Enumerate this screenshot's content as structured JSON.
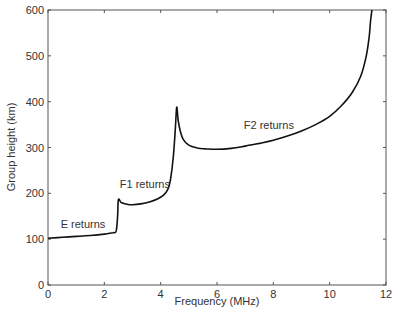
{
  "chart_data": {
    "type": "line",
    "title": "",
    "xlabel": "Frequency (MHz)",
    "ylabel": "Group height (km)",
    "xlim": [
      0,
      12
    ],
    "ylim": [
      0,
      600
    ],
    "xticks": [
      0,
      2,
      4,
      6,
      8,
      10,
      12
    ],
    "yticks": [
      0,
      100,
      200,
      300,
      400,
      500,
      600
    ],
    "grid": false,
    "legend": null,
    "annotations": [
      {
        "text": "E returns",
        "x": 0.45,
        "y": 125
      },
      {
        "text": "F1 returns",
        "x": 2.55,
        "y": 212
      },
      {
        "text": "F2 returns",
        "x": 6.95,
        "y": 340
      }
    ],
    "series": [
      {
        "name": "ionogram trace",
        "color": "#111111",
        "x": [
          0.0,
          0.5,
          1.0,
          1.5,
          2.0,
          2.3,
          2.42,
          2.47,
          2.5,
          2.6,
          2.8,
          3.0,
          3.3,
          3.6,
          3.9,
          4.1,
          4.25,
          4.35,
          4.45,
          4.52,
          4.57,
          4.62,
          4.7,
          4.8,
          5.0,
          5.3,
          5.6,
          6.0,
          6.5,
          7.0,
          7.5,
          8.0,
          8.5,
          9.0,
          9.5,
          10.0,
          10.4,
          10.8,
          11.1,
          11.3,
          11.4,
          11.45,
          11.5
        ],
        "y": [
          102,
          104,
          106,
          108,
          111,
          114,
          118,
          150,
          186,
          180,
          176,
          175,
          177,
          181,
          188,
          196,
          208,
          230,
          280,
          340,
          388,
          360,
          335,
          318,
          305,
          299,
          297,
          296,
          298,
          303,
          309,
          316,
          325,
          336,
          350,
          368,
          390,
          420,
          455,
          500,
          540,
          575,
          600
        ]
      }
    ]
  }
}
